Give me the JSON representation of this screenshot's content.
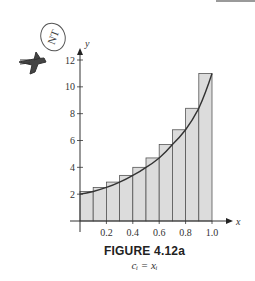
{
  "figure": {
    "title": "FIGURE 4.12a",
    "subtitle": "c_i = x_i",
    "subtitle_display": "cᵢ = xᵢ"
  },
  "chart_data": {
    "type": "bar",
    "title": "FIGURE 4.12a",
    "subtitle": "c_i = x_i (right-endpoint Riemann sum rectangles under curve)",
    "xlabel": "x",
    "ylabel": "y",
    "xlim": [
      0,
      1.0
    ],
    "ylim": [
      0,
      12
    ],
    "x_ticks": [
      "0.2",
      "0.4",
      "0.6",
      "0.8",
      "1.0"
    ],
    "y_ticks": [
      "2",
      "4",
      "6",
      "8",
      "10",
      "12"
    ],
    "grid": false,
    "legend": null,
    "categories": [
      "[0,0.1]",
      "[0.1,0.2]",
      "[0.2,0.3]",
      "[0.3,0.4]",
      "[0.4,0.5]",
      "[0.5,0.6]",
      "[0.6,0.7]",
      "[0.7,0.8]",
      "[0.8,0.9]",
      "[0.9,1.0]"
    ],
    "values": [
      2.2,
      2.5,
      2.9,
      3.4,
      4.0,
      4.7,
      5.7,
      6.8,
      8.4,
      11.0
    ],
    "curve": {
      "description": "increasing curve from (0,2) to (1,11)",
      "points": [
        [
          0,
          2.0
        ],
        [
          0.1,
          2.2
        ],
        [
          0.2,
          2.5
        ],
        [
          0.3,
          2.9
        ],
        [
          0.4,
          3.4
        ],
        [
          0.5,
          4.0
        ],
        [
          0.6,
          4.7
        ],
        [
          0.7,
          5.7
        ],
        [
          0.8,
          6.8
        ],
        [
          0.9,
          8.4
        ],
        [
          1.0,
          11.0
        ]
      ]
    },
    "bar_color": "#dcdcdc",
    "bar_edge_color": "#555555",
    "curve_color": "#333333"
  },
  "decorations": {
    "margin_stamp": "NT",
    "margin_icon": "bird-sketch-icon"
  }
}
